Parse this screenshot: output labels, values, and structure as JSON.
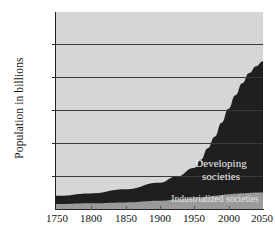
{
  "chart_data": {
    "type": "area",
    "title": "",
    "subtitle": "",
    "xlabel": "",
    "ylabel": "Population in billions",
    "xlim": [
      1750,
      2050
    ],
    "ylim": [
      0,
      12
    ],
    "grid": true,
    "gridlines_y": [
      2,
      4,
      6,
      8,
      10
    ],
    "xticks": [
      1750,
      1800,
      1850,
      1900,
      1950,
      2000,
      2050
    ],
    "yticks": [
      0,
      2,
      4,
      6,
      8,
      10,
      12
    ],
    "legend_position": "inline-annotations",
    "stacked": true,
    "x": [
      1750,
      1800,
      1850,
      1900,
      1925,
      1950,
      1960,
      1970,
      1980,
      1990,
      2000,
      2010,
      2020,
      2030,
      2040,
      2050
    ],
    "series": [
      {
        "name": "Industrialized societies",
        "color": "#9a9a9a",
        "values": [
          0.3,
          0.35,
          0.4,
          0.5,
          0.58,
          0.65,
          0.7,
          0.75,
          0.8,
          0.85,
          0.9,
          0.93,
          0.96,
          0.98,
          1.0,
          1.0
        ]
      },
      {
        "name": "Developing societies",
        "color": "#201f1f",
        "values": [
          0.5,
          0.6,
          0.8,
          1.1,
          1.4,
          1.85,
          2.3,
          2.95,
          3.6,
          4.4,
          5.2,
          6.0,
          6.7,
          7.3,
          7.7,
          8.0
        ]
      }
    ],
    "totals": [
      0.8,
      0.95,
      1.2,
      1.6,
      2.0,
      2.5,
      3.0,
      3.7,
      4.4,
      5.25,
      6.1,
      6.93,
      7.66,
      8.28,
      8.7,
      9.0
    ],
    "annotations": [
      {
        "text": "Developing societies",
        "line1": "Developing",
        "line2": "societies",
        "color": "#f2f2f2"
      },
      {
        "text": "Industrialized societies",
        "color": "#e8e8e8"
      }
    ],
    "plot_background": "#d6d6d6"
  },
  "axis": {
    "y_title": "Population in billions",
    "y_ticks": [
      "0",
      "2",
      "4",
      "6",
      "8",
      "10",
      "12"
    ],
    "x_ticks": [
      "1750",
      "1800",
      "1850",
      "1900",
      "1950",
      "2000",
      "2050"
    ]
  },
  "labels": {
    "developing_line1": "Developing",
    "developing_line2": "societies",
    "industrialized": "Industrialized societies"
  }
}
